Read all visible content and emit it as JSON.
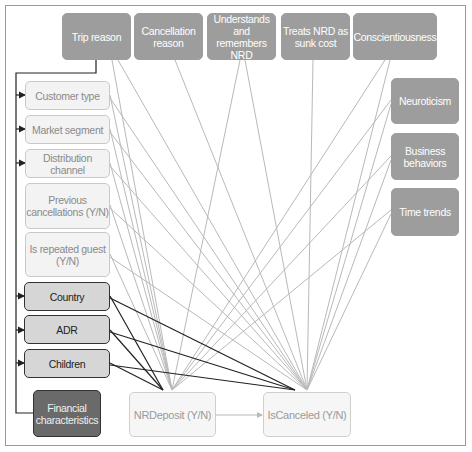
{
  "diagram": {
    "type": "causal-diagram",
    "colors": {
      "unobserved_fill": "#9d9d9d",
      "observed_fill": "#f3f3f3",
      "confounder_fill": "#d6d6d6",
      "financial_fill": "#6a6a6a",
      "light_edge": "#b9b9b9",
      "dark_edge": "#222222"
    },
    "top_nodes": [
      {
        "id": "trip_reason",
        "label": "Trip reason"
      },
      {
        "id": "cancellation_reason",
        "label": "Cancellation reason"
      },
      {
        "id": "understands_nrd",
        "label": "Understands and remembers NRD"
      },
      {
        "id": "sunk_cost",
        "label": "Treats NRD as sunk cost"
      },
      {
        "id": "conscientiousness",
        "label": "Conscientiousness"
      }
    ],
    "right_nodes": [
      {
        "id": "neuroticism",
        "label": "Neuroticism"
      },
      {
        "id": "business_behaviors",
        "label": "Business behaviors"
      },
      {
        "id": "time_trends",
        "label": "Time trends"
      }
    ],
    "left_nodes": [
      {
        "id": "customer_type",
        "label": "Customer type"
      },
      {
        "id": "market_segment",
        "label": "Market segment"
      },
      {
        "id": "distribution_channel",
        "label": "Distribution channel"
      },
      {
        "id": "previous_cancellations",
        "label": "Previous cancellations (Y/N)"
      },
      {
        "id": "is_repeated_guest",
        "label": "Is repeated guest (Y/N)"
      }
    ],
    "confounder_nodes": [
      {
        "id": "country",
        "label": "Country"
      },
      {
        "id": "adr",
        "label": "ADR"
      },
      {
        "id": "children",
        "label": "Children"
      }
    ],
    "financial_node": {
      "id": "financial",
      "label": "Financial characteristics"
    },
    "outcome_nodes": {
      "treatment": {
        "id": "nrdeposit",
        "label": "NRDeposit (Y/N)"
      },
      "outcome": {
        "id": "iscanceled",
        "label": "IsCanceled (Y/N)"
      }
    },
    "edges_summary": [
      "Trip reason -> Customer type, Market segment, Distribution channel, Country, ADR, Children, Financial characteristics (bracket)",
      "All top, right, and left nodes -> NRDeposit (Y/N) and IsCanceled (Y/N)",
      "Country, ADR, Children -> NRDeposit (Y/N) and IsCanceled (Y/N) (dark edges)",
      "NRDeposit (Y/N) -> IsCanceled (Y/N)"
    ]
  }
}
